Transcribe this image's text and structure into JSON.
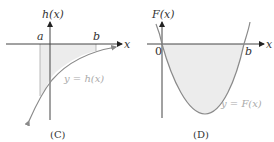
{
  "panels": [
    {
      "caption": "(C)",
      "y_axis_label": "h(x)",
      "x_axis_label": "x",
      "point_labels": [
        "a",
        "b"
      ],
      "curve_label": "y = h(x)",
      "description": "Increasing concave-down curve below the x-axis approaching it asymptotically; region between a and b bounded by curve and x-axis shaded"
    },
    {
      "caption": "(D)",
      "y_axis_label": "F(x)",
      "x_axis_label": "x",
      "point_labels": [
        "0",
        "b"
      ],
      "curve_label": "y = F(x)",
      "description": "Upward-opening parabola with roots at 0 and b; region below x-axis between 0 and b shaded"
    }
  ],
  "colors": {
    "axis": "#444444",
    "curve": "#8a8a8a",
    "shade": "#ececec",
    "text": "#333333",
    "curve_label": "#aaaaaa"
  }
}
